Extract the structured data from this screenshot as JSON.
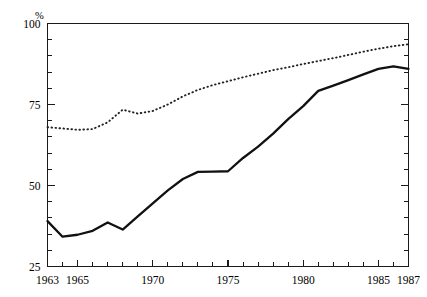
{
  "chart_data": {
    "type": "line",
    "title": "",
    "subtitle": "",
    "xlabel": "",
    "ylabel": "%",
    "unit_label": "%",
    "grid": false,
    "legend_position": "none",
    "xlim": [
      1963,
      1987
    ],
    "ylim": [
      25,
      100
    ],
    "y_ticks_major": [
      25,
      50,
      75,
      100
    ],
    "y_tick_labels": [
      "25",
      "50",
      "75",
      "100"
    ],
    "y_tick_minor_step": 5,
    "x_ticks_major": [
      1963,
      1965,
      1970,
      1975,
      1980,
      1985,
      1987
    ],
    "x_tick_labels": [
      "1963",
      "1965",
      "1970",
      "1975",
      "1980",
      "1985",
      "1987"
    ],
    "x_tick_all_years": [
      1963,
      1964,
      1965,
      1966,
      1967,
      1968,
      1969,
      1970,
      1971,
      1972,
      1973,
      1974,
      1975,
      1976,
      1977,
      1978,
      1979,
      1980,
      1981,
      1982,
      1983,
      1984,
      1985,
      1986,
      1987
    ],
    "x": [
      1963,
      1964,
      1965,
      1966,
      1967,
      1968,
      1969,
      1970,
      1971,
      1972,
      1973,
      1974,
      1975,
      1976,
      1977,
      1978,
      1979,
      1980,
      1981,
      1982,
      1983,
      1984,
      1985,
      1986,
      1987
    ],
    "series": [
      {
        "name": "upper-dotted-series",
        "style": "dotted",
        "color": "#222222",
        "values": [
          68.0,
          67.6,
          67.2,
          67.4,
          69.5,
          73.4,
          72.2,
          73.0,
          75.0,
          77.5,
          79.5,
          81.0,
          82.2,
          83.4,
          84.5,
          85.6,
          86.5,
          87.5,
          88.4,
          89.3,
          90.3,
          91.3,
          92.2,
          93.0,
          93.6
        ]
      },
      {
        "name": "lower-solid-series",
        "style": "solid",
        "color": "#111111",
        "values": [
          39.0,
          34.2,
          34.8,
          36.0,
          38.6,
          36.4,
          40.5,
          44.5,
          48.5,
          52.0,
          54.2,
          54.3,
          54.4,
          58.5,
          62.0,
          66.0,
          70.5,
          74.5,
          79.2,
          80.8,
          82.5,
          84.3,
          86.0,
          86.8,
          86.0
        ]
      }
    ]
  },
  "axes": {
    "y_axis_name": "percent-axis",
    "x_axis_name": "year-axis"
  }
}
